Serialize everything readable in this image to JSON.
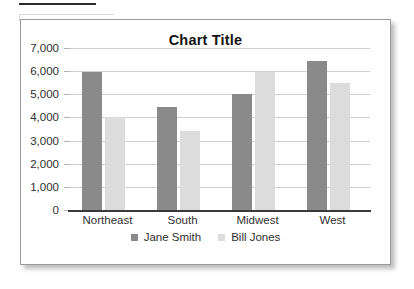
{
  "chart_data": {
    "type": "bar",
    "title": "Chart Title",
    "xlabel": "",
    "ylabel": "",
    "ylim": [
      0,
      7000
    ],
    "ytick_step": 1000,
    "ytick_labels": [
      "7,000",
      "6,000",
      "5,000",
      "4,000",
      "3,000",
      "2,000",
      "1,000",
      "0"
    ],
    "ytick_values": [
      7000,
      6000,
      5000,
      4000,
      3000,
      2000,
      1000,
      0
    ],
    "grid": true,
    "legend_position": "bottom",
    "categories": [
      "Northeast",
      "South",
      "Midwest",
      "West"
    ],
    "series": [
      {
        "name": "Jane Smith",
        "color": "#8a8a8a",
        "values": [
          5950,
          4450,
          5000,
          6450
        ]
      },
      {
        "name": "Bill Jones",
        "color": "#dcdcdc",
        "values": [
          4000,
          3400,
          5950,
          5480
        ]
      }
    ]
  },
  "frame": {
    "border_color": "#9a9a9a",
    "background": "#ffffff"
  }
}
